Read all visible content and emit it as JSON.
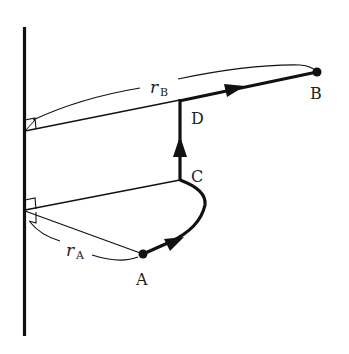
{
  "diagram": {
    "labels": {
      "A": "A",
      "B": "B",
      "C": "C",
      "D": "D",
      "rA_main": "r",
      "rA_sub": "A",
      "rB_main": "r",
      "rB_sub": "B"
    },
    "colors": {
      "stroke": "#111111",
      "text": "#222222",
      "background": "#ffffff"
    },
    "path_segments": [
      {
        "from": "A",
        "to": "C",
        "shape": "curve"
      },
      {
        "from": "C",
        "to": "D",
        "shape": "straight"
      },
      {
        "from": "D",
        "to": "B",
        "shape": "straight"
      }
    ]
  }
}
